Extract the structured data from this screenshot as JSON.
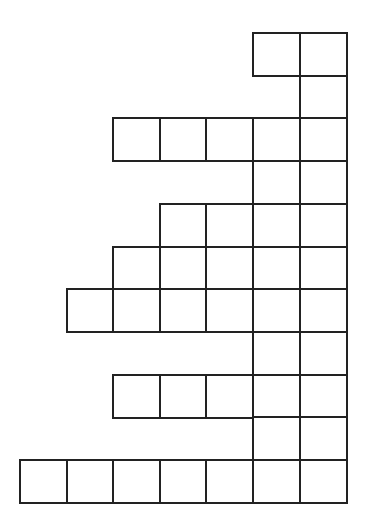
{
  "diagram": {
    "type": "square-grid-figure",
    "line_color": "#222222",
    "background": "#ffffff",
    "origin_x": 20,
    "origin_y": 33,
    "cell_width": 46.6,
    "cell_height": 42.7,
    "columns": 7,
    "rows": [
      {
        "row": 0,
        "cols": [
          5,
          6
        ]
      },
      {
        "row": 1,
        "cols": [
          6
        ]
      },
      {
        "row": 2,
        "cols": [
          2,
          3,
          4,
          5,
          6
        ]
      },
      {
        "row": 3,
        "cols": [
          5,
          6
        ]
      },
      {
        "row": 4,
        "cols": [
          3,
          4,
          5,
          6
        ]
      },
      {
        "row": 5,
        "cols": [
          2,
          3,
          4,
          5,
          6
        ]
      },
      {
        "row": 6,
        "cols": [
          1,
          2,
          3,
          4,
          5,
          6
        ]
      },
      {
        "row": 7,
        "cols": [
          5,
          6
        ]
      },
      {
        "row": 8,
        "cols": [
          2,
          3,
          4,
          5,
          6
        ]
      },
      {
        "row": 9,
        "cols": [
          5,
          6
        ]
      },
      {
        "row": 10,
        "cols": [
          0,
          1,
          2,
          3,
          4,
          5,
          6
        ]
      }
    ]
  }
}
